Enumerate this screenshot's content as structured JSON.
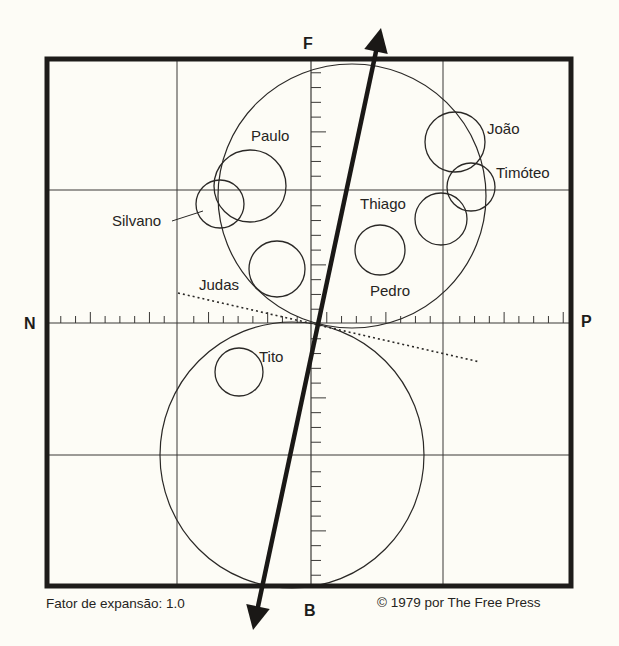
{
  "diagram": {
    "type": "grid-plot",
    "axes": {
      "top_label": "F",
      "bottom_label": "B",
      "left_label": "N",
      "right_label": "P"
    },
    "groups": [
      {
        "id": "upper-group-circle",
        "cx": 352,
        "cy": 196,
        "rx": 134,
        "ry": 132
      },
      {
        "id": "lower-group-circle",
        "cx": 292,
        "cy": 455,
        "rx": 132,
        "ry": 133
      }
    ],
    "members": [
      {
        "name": "Paulo",
        "cx": 250,
        "cy": 186,
        "r": 36,
        "label_x": 251,
        "label_y": 128
      },
      {
        "name": "Silvano",
        "cx": 220,
        "cy": 204,
        "r": 24,
        "label_x": 112,
        "label_y": 213
      },
      {
        "name": "Judas",
        "cx": 277,
        "cy": 269,
        "r": 28,
        "label_x": 199,
        "label_y": 277
      },
      {
        "name": "João",
        "cx": 455,
        "cy": 142,
        "r": 30,
        "label_x": 487,
        "label_y": 121
      },
      {
        "name": "Timóteo",
        "cx": 471,
        "cy": 187,
        "r": 24,
        "label_x": 496,
        "label_y": 165
      },
      {
        "name": "Thiago",
        "cx": 441,
        "cy": 219,
        "r": 26,
        "label_x": 360,
        "label_y": 196
      },
      {
        "name": "Pedro",
        "cx": 380,
        "cy": 250,
        "r": 25,
        "label_x": 370,
        "label_y": 283
      },
      {
        "name": "Tito",
        "cx": 239,
        "cy": 372,
        "r": 24,
        "label_x": 259,
        "label_y": 349
      }
    ],
    "vector_arrow": {
      "x1": 253,
      "y1": 630,
      "x2": 381,
      "y2": 28
    },
    "dotted_line": {
      "x1": 178,
      "y1": 293,
      "x2": 480,
      "y2": 362
    }
  },
  "footer": {
    "expansion_factor": "Fator de expansão: 1.0",
    "copyright": "© 1979 por The Free Press"
  }
}
